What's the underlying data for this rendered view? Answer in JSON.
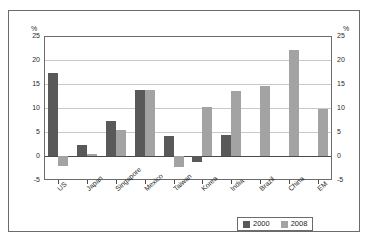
{
  "caption_strip": "",
  "axis_unit": {
    "left": "%",
    "right": "%"
  },
  "legend": {
    "items": [
      {
        "label": "2000",
        "color": "#595959"
      },
      {
        "label": "2008",
        "color": "#a3a3a3"
      }
    ]
  },
  "chart_data": {
    "type": "bar",
    "title": "",
    "subtitle": "",
    "xlabel": "",
    "ylabel": "%",
    "y2label": "%",
    "ylim": [
      -5,
      25
    ],
    "yticks": [
      25,
      20,
      15,
      10,
      5,
      0,
      -5
    ],
    "ytick_labels": [
      "25",
      "20",
      "15",
      "10",
      "5",
      "0",
      "-5"
    ],
    "y2tick_labels": [
      "25",
      "20",
      "15",
      "10",
      "5",
      "0",
      "-5"
    ],
    "grid": true,
    "grid_axis": "y",
    "legend_position": "bottom-right",
    "bar_colors": {
      "2000": "#595959",
      "2008": "#a3a3a3"
    },
    "categories": [
      "US",
      "Japan",
      "Singapore",
      "Mexico",
      "Taiwan",
      "Korea",
      "India",
      "Brazil",
      "China",
      "EM"
    ],
    "series": [
      {
        "name": "2000",
        "color": "#595959",
        "values": [
          17.3,
          2.2,
          7.3,
          13.8,
          4.2,
          -1.3,
          4.3,
          0.0,
          0.0,
          0.0
        ]
      },
      {
        "name": "2008",
        "color": "#a3a3a3",
        "values": [
          -2.0,
          0.5,
          5.5,
          13.8,
          -2.3,
          10.3,
          13.5,
          14.6,
          22.0,
          9.8
        ]
      }
    ]
  }
}
